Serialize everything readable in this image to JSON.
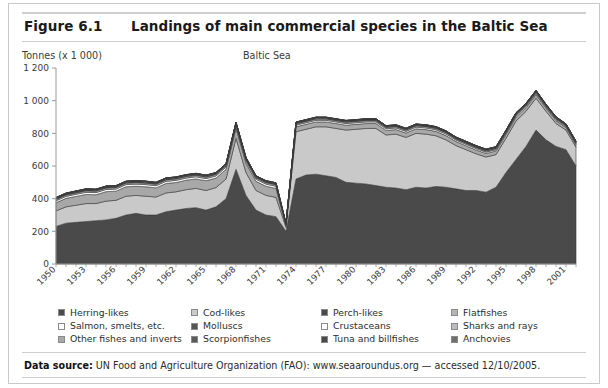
{
  "figure": {
    "number": "Figure 6.1",
    "title": "Landings of main commercial species in the Baltic Sea"
  },
  "chart_labels": {
    "yaxis_unit": "Tonnes (x 1 000)",
    "series_title": "Baltic Sea"
  },
  "source": {
    "label": "Data source:",
    "text": " UN Food and Agriculture Organization (FAO): www.seaaroundus.org — accessed 12/10/2005."
  },
  "legend": [
    {
      "label": "Herring-likes",
      "color": "#4a4a4a"
    },
    {
      "label": "Cod-likes",
      "color": "#c9c9c9"
    },
    {
      "label": "Perch-likes",
      "color": "#4a4a4a"
    },
    {
      "label": "Flatfishes",
      "color": "#b4b4b4"
    },
    {
      "label": "Salmon, smelts, etc.",
      "color": "#ffffff"
    },
    {
      "label": "Molluscs",
      "color": "#555555"
    },
    {
      "label": "Crustaceans",
      "color": "#ffffff"
    },
    {
      "label": "Sharks and rays",
      "color": "#bdbdbd"
    },
    {
      "label": "Other fishes and inverts",
      "color": "#a8a8a8"
    },
    {
      "label": "Scorpionfishes",
      "color": "#5a5a5a"
    },
    {
      "label": "Tuna and billfishes",
      "color": "#4a4a4a"
    },
    {
      "label": "Anchovies",
      "color": "#6e6e6e"
    }
  ],
  "chart_data": {
    "type": "area",
    "title": "Landings of main commercial species in the Baltic Sea",
    "subtitle": "Baltic Sea",
    "xlabel": "",
    "ylabel": "Tonnes (x 1 000)",
    "ylim": [
      0,
      1200
    ],
    "yticks": [
      0,
      200,
      400,
      600,
      800,
      1000,
      1200
    ],
    "ytick_labels": [
      "0",
      "200",
      "400",
      "600",
      "800",
      "1 000",
      "1 200"
    ],
    "grid": false,
    "legend_position": "bottom",
    "stacked": true,
    "x": [
      1950,
      1951,
      1952,
      1953,
      1954,
      1955,
      1956,
      1957,
      1958,
      1959,
      1960,
      1961,
      1962,
      1963,
      1964,
      1965,
      1966,
      1967,
      1968,
      1969,
      1970,
      1971,
      1972,
      1973,
      1974,
      1975,
      1976,
      1977,
      1978,
      1979,
      1980,
      1981,
      1982,
      1983,
      1984,
      1985,
      1986,
      1987,
      1988,
      1989,
      1990,
      1991,
      1992,
      1993,
      1994,
      1995,
      1996,
      1997,
      1998,
      1999,
      2000,
      2001,
      2002
    ],
    "xtick_labels": [
      "1950",
      "1953",
      "1956",
      "1959",
      "1962",
      "1965",
      "1968",
      "1971",
      "1974",
      "1977",
      "1980",
      "1983",
      "1986",
      "1989",
      "1992",
      "1995",
      "1998",
      "2001"
    ],
    "xtick_values": [
      1950,
      1953,
      1956,
      1959,
      1962,
      1965,
      1968,
      1971,
      1974,
      1977,
      1980,
      1983,
      1986,
      1989,
      1992,
      1995,
      1998,
      2001
    ],
    "series": [
      {
        "name": "Herring-likes",
        "color": "#4a4a4a",
        "values": [
          230,
          250,
          255,
          260,
          265,
          270,
          280,
          300,
          310,
          300,
          300,
          320,
          330,
          340,
          345,
          330,
          350,
          400,
          580,
          420,
          330,
          300,
          290,
          200,
          520,
          545,
          550,
          540,
          530,
          500,
          495,
          490,
          480,
          470,
          465,
          455,
          470,
          465,
          475,
          470,
          460,
          450,
          450,
          440,
          470,
          560,
          640,
          720,
          820,
          760,
          720,
          700,
          600
        ]
      },
      {
        "name": "Cod-likes",
        "color": "#c9c9c9",
        "values": [
          95,
          100,
          105,
          110,
          105,
          115,
          110,
          115,
          110,
          115,
          110,
          115,
          112,
          115,
          118,
          120,
          118,
          120,
          190,
          140,
          120,
          120,
          118,
          25,
          290,
          280,
          290,
          300,
          300,
          320,
          330,
          340,
          350,
          320,
          330,
          320,
          330,
          330,
          310,
          290,
          265,
          250,
          225,
          215,
          200,
          210,
          235,
          215,
          195,
          175,
          140,
          120,
          115
        ]
      },
      {
        "name": "Other fishes and inverts",
        "color": "#a8a8a8",
        "values": [
          50,
          52,
          54,
          56,
          54,
          58,
          56,
          58,
          56,
          58,
          56,
          58,
          57,
          58,
          58,
          60,
          58,
          60,
          62,
          58,
          56,
          56,
          55,
          12,
          30,
          30,
          30,
          30,
          30,
          30,
          30,
          30,
          30,
          28,
          28,
          27,
          28,
          28,
          27,
          26,
          25,
          24,
          23,
          22,
          22,
          23,
          24,
          23,
          22,
          20,
          18,
          16,
          15
        ]
      },
      {
        "name": "Salmon, smelts, etc.",
        "color": "#ffffff",
        "values": [
          12,
          12,
          13,
          13,
          13,
          13,
          13,
          13,
          13,
          13,
          13,
          13,
          13,
          13,
          13,
          13,
          13,
          13,
          14,
          13,
          13,
          13,
          13,
          4,
          10,
          10,
          10,
          10,
          10,
          10,
          10,
          10,
          10,
          10,
          10,
          10,
          10,
          10,
          10,
          10,
          9,
          9,
          9,
          8,
          8,
          8,
          9,
          8,
          8,
          7,
          7,
          6,
          6
        ]
      },
      {
        "name": "Flatfishes",
        "color": "#b4b4b4",
        "values": [
          8,
          8,
          8,
          9,
          9,
          9,
          9,
          9,
          9,
          9,
          9,
          9,
          9,
          9,
          9,
          9,
          9,
          9,
          10,
          9,
          9,
          9,
          9,
          3,
          8,
          8,
          8,
          8,
          8,
          8,
          8,
          8,
          8,
          8,
          8,
          8,
          8,
          8,
          8,
          8,
          7,
          7,
          7,
          7,
          7,
          7,
          7,
          7,
          7,
          6,
          6,
          6,
          5
        ]
      },
      {
        "name": "Perch-likes",
        "color": "#4a4a4a",
        "values": [
          6,
          6,
          6,
          6,
          6,
          6,
          6,
          6,
          6,
          6,
          6,
          6,
          6,
          6,
          6,
          6,
          6,
          6,
          6,
          6,
          6,
          6,
          6,
          2,
          5,
          5,
          5,
          5,
          5,
          5,
          5,
          5,
          5,
          5,
          5,
          5,
          5,
          5,
          5,
          5,
          5,
          5,
          5,
          5,
          5,
          5,
          5,
          5,
          5,
          4,
          4,
          4,
          4
        ]
      },
      {
        "name": "Crustaceans",
        "color": "#ffffff",
        "values": [
          2,
          2,
          2,
          2,
          2,
          2,
          2,
          2,
          2,
          2,
          2,
          2,
          2,
          2,
          2,
          2,
          2,
          2,
          2,
          2,
          2,
          2,
          2,
          1,
          2,
          2,
          2,
          2,
          2,
          2,
          2,
          2,
          2,
          2,
          2,
          2,
          2,
          2,
          2,
          2,
          2,
          2,
          2,
          2,
          2,
          2,
          2,
          2,
          2,
          2,
          2,
          2,
          2
        ]
      },
      {
        "name": "Molluscs",
        "color": "#555555",
        "values": [
          2,
          2,
          2,
          2,
          2,
          2,
          2,
          2,
          2,
          2,
          2,
          2,
          2,
          2,
          2,
          2,
          2,
          2,
          2,
          2,
          2,
          2,
          2,
          1,
          2,
          2,
          2,
          2,
          2,
          2,
          2,
          2,
          2,
          2,
          2,
          2,
          2,
          2,
          2,
          2,
          2,
          2,
          2,
          2,
          2,
          2,
          2,
          2,
          2,
          2,
          2,
          2,
          2
        ]
      },
      {
        "name": "Sharks and rays",
        "color": "#bdbdbd",
        "values": [
          1,
          1,
          1,
          1,
          1,
          1,
          1,
          1,
          1,
          1,
          1,
          1,
          1,
          1,
          1,
          1,
          1,
          1,
          1,
          1,
          1,
          1,
          1,
          0,
          1,
          1,
          1,
          1,
          1,
          1,
          1,
          1,
          1,
          1,
          1,
          1,
          1,
          1,
          1,
          1,
          1,
          1,
          1,
          1,
          1,
          1,
          1,
          1,
          1,
          1,
          1,
          1,
          1
        ]
      },
      {
        "name": "Scorpionfishes",
        "color": "#5a5a5a",
        "values": [
          1,
          1,
          1,
          1,
          1,
          1,
          1,
          1,
          1,
          1,
          1,
          1,
          1,
          1,
          1,
          1,
          1,
          1,
          1,
          1,
          1,
          1,
          1,
          0,
          1,
          1,
          1,
          1,
          1,
          1,
          1,
          1,
          1,
          1,
          1,
          1,
          1,
          1,
          1,
          1,
          1,
          1,
          1,
          1,
          1,
          1,
          1,
          1,
          1,
          1,
          1,
          1,
          1
        ]
      },
      {
        "name": "Tuna and billfishes",
        "color": "#4a4a4a",
        "values": [
          0,
          0,
          0,
          0,
          0,
          0,
          0,
          0,
          0,
          0,
          0,
          0,
          0,
          0,
          0,
          0,
          0,
          0,
          0,
          0,
          0,
          0,
          0,
          0,
          0,
          0,
          0,
          0,
          0,
          0,
          0,
          0,
          0,
          0,
          0,
          0,
          0,
          0,
          0,
          0,
          0,
          0,
          0,
          0,
          0,
          0,
          0,
          0,
          0,
          0,
          0,
          0,
          0
        ]
      },
      {
        "name": "Anchovies",
        "color": "#6e6e6e",
        "values": [
          0,
          0,
          0,
          0,
          0,
          0,
          0,
          0,
          0,
          0,
          0,
          0,
          0,
          0,
          0,
          0,
          0,
          0,
          0,
          0,
          0,
          0,
          0,
          0,
          0,
          0,
          0,
          0,
          0,
          0,
          0,
          0,
          0,
          0,
          0,
          0,
          0,
          0,
          0,
          0,
          0,
          0,
          0,
          0,
          0,
          0,
          0,
          0,
          0,
          0,
          0,
          0,
          0
        ]
      }
    ]
  }
}
